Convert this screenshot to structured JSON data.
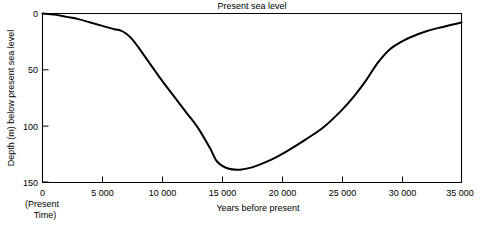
{
  "chart_data": {
    "type": "line",
    "title": "",
    "xlabel": "Years before present",
    "ylabel": "Depth (m) below present sea level",
    "top_axis_label": "Present sea level",
    "origin_note_line1": "(Present",
    "origin_note_line2": "Time)",
    "grid": false,
    "legend": "none",
    "xlim": [
      0,
      35000
    ],
    "ylim": [
      0,
      150
    ],
    "y_axis_inverted": true,
    "x_ticks": [
      0,
      5000,
      10000,
      15000,
      20000,
      25000,
      30000,
      35000
    ],
    "x_tick_labels": [
      "0",
      "5 000",
      "10 000",
      "15 000",
      "20 000",
      "25 000",
      "30 000",
      "35 000"
    ],
    "y_ticks": [
      0,
      50,
      100,
      150
    ],
    "y_tick_labels": [
      "0",
      "50",
      "100",
      "150"
    ],
    "series": [
      {
        "name": "Sea level depth",
        "color": "#000000",
        "x": [
          0,
          1000,
          2000,
          3000,
          4000,
          5000,
          6000,
          6500,
          7000,
          7500,
          8000,
          9000,
          10000,
          11000,
          12000,
          13000,
          14000,
          14600,
          15500,
          16500,
          17500,
          18500,
          19500,
          20500,
          22000,
          23500,
          25000,
          26000,
          27000,
          28000,
          29000,
          30000,
          31000,
          32000,
          33000,
          35000
        ],
        "y": [
          0,
          1,
          3,
          5,
          8,
          11,
          14,
          15,
          18,
          23,
          30,
          45,
          60,
          74,
          88,
          102,
          120,
          132,
          138,
          139,
          137,
          133,
          128,
          122,
          112,
          101,
          86,
          74,
          60,
          44,
          32,
          25,
          20,
          16,
          13,
          8
        ]
      }
    ]
  }
}
